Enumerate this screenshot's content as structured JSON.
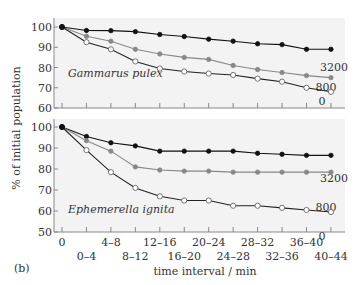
{
  "figure_label": "(b)",
  "xlabel": "time interval / min",
  "ylabel": "% of initial population",
  "colors": {
    "panel_bg": "#f3f3f3",
    "axis": "#888888",
    "series_3200": "#111111",
    "series_800": "#888888",
    "series_0_line": "#222222",
    "series_0_fill": "#ffffff"
  },
  "chart_data": [
    {
      "type": "line",
      "title": "Gammarus pulex",
      "xlabel": "time interval / min",
      "ylabel": "% of initial population",
      "ylim": [
        60,
        100
      ],
      "yticks": [
        60,
        70,
        80,
        90,
        100
      ],
      "categories": [
        "0",
        "0–4",
        "4–8",
        "8–12",
        "12–16",
        "16–20",
        "20–24",
        "24–28",
        "28–32",
        "32–36",
        "36–40",
        "40–44"
      ],
      "series": [
        {
          "name": "3200",
          "values": [
            100,
            98.3,
            98.2,
            97.7,
            96.3,
            95.3,
            94,
            93,
            91.7,
            91.3,
            89,
            89
          ]
        },
        {
          "name": "800",
          "values": [
            100,
            95.4,
            93,
            89,
            86.7,
            85,
            84,
            81,
            79,
            77.5,
            76,
            75
          ]
        },
        {
          "name": "0",
          "values": [
            100,
            92.5,
            89,
            83,
            79.5,
            78,
            77,
            76.3,
            74.5,
            73,
            70,
            68
          ]
        }
      ]
    },
    {
      "type": "line",
      "title": "Ephemerella ignita",
      "xlabel": "time interval / min",
      "ylabel": "% of initial population",
      "ylim": [
        50,
        100
      ],
      "yticks": [
        50,
        60,
        70,
        80,
        90,
        100
      ],
      "categories": [
        "0",
        "0–4",
        "4–8",
        "8–12",
        "12–16",
        "16–20",
        "20–24",
        "24–28",
        "28–32",
        "32–36",
        "36–40",
        "40–44"
      ],
      "series": [
        {
          "name": "3200",
          "values": [
            100,
            95.5,
            92.5,
            91,
            88.5,
            88.5,
            88.5,
            88.5,
            87.5,
            87,
            86.5,
            86.5
          ]
        },
        {
          "name": "800",
          "values": [
            100,
            93.5,
            88.5,
            81,
            79.5,
            79,
            79,
            78.5,
            78.5,
            78.5,
            78.5,
            78.5
          ]
        },
        {
          "name": "0",
          "values": [
            100,
            89,
            78.5,
            71,
            67,
            65,
            65,
            62.5,
            62.5,
            61.5,
            60.5,
            59.5
          ]
        }
      ]
    }
  ]
}
